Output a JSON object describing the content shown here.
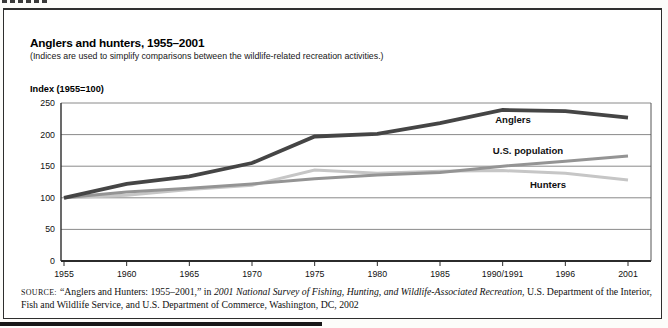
{
  "figure": {
    "title": "Anglers and hunters, 1955–2001",
    "subtitle": "(Indices are used to simplify comparisons between the wildlife-related recreation activities.)",
    "axis_title": "Index (1955=100)"
  },
  "chart_data": {
    "type": "line",
    "title": "Anglers and hunters, 1955–2001",
    "xlabel": "",
    "ylabel": "Index (1955=100)",
    "ylim": [
      0,
      250
    ],
    "yticks": [
      0,
      50,
      100,
      150,
      200,
      250
    ],
    "grid": true,
    "legend_position": "inline-right-of-lines",
    "categories": [
      "1955",
      "1960",
      "1965",
      "1970",
      "1975",
      "1980",
      "1985",
      "1990/1991",
      "1996",
      "2001"
    ],
    "series": [
      {
        "name": "Anglers",
        "color": "#454545",
        "values": [
          100,
          122,
          134,
          155,
          197,
          201,
          218,
          239,
          237,
          227
        ]
      },
      {
        "name": "U.S. population",
        "color": "#949494",
        "values": [
          100,
          109,
          115,
          122,
          130,
          136,
          140,
          150,
          158,
          166
        ]
      },
      {
        "name": "Hunters",
        "color": "#c6c6c6",
        "values": [
          100,
          104,
          113,
          120,
          144,
          139,
          142,
          143,
          139,
          128
        ]
      }
    ]
  },
  "source": {
    "label": "SOURCE:",
    "text_before_italic": "“Anglers and Hunters: 1955–2001,” in ",
    "italic_title": "2001 National Survey of Fishing, Hunting, and Wildlife-Associated Recreation",
    "text_after_italic": ", U.S. Department of the Interior, Fish and Wildlife Service, and U.S. Department of Commerce, Washington, DC, 2002"
  }
}
